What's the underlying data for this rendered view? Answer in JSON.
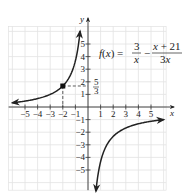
{
  "chart_data": {
    "type": "line",
    "title": "",
    "function_label": "f(x) = 3/x − (x + 21)/(3x)",
    "formula": {
      "lhs": "f(x) =",
      "term1_num": "3",
      "term1_den": "x",
      "minus": "−",
      "term2_num": "x + 21",
      "term2_den": "3x"
    },
    "xlabel": "x",
    "ylabel": "y",
    "xlim": [
      -6.3,
      6.2
    ],
    "ylim": [
      -6.6,
      6.4
    ],
    "x_ticks": [
      -5,
      -4,
      -3,
      -2,
      -1,
      1,
      2,
      3,
      4,
      5
    ],
    "x_tick_labels": [
      "−5",
      "−4",
      "−3",
      "−2",
      "−1",
      "1",
      "2",
      "3",
      "4",
      "5"
    ],
    "y_ticks": [
      -5,
      -4,
      -3,
      -2,
      -1,
      1,
      2,
      3,
      4,
      5
    ],
    "y_tick_labels": [
      "−5",
      "−4",
      "−3",
      "−2",
      "−1",
      "1",
      "2",
      "3",
      "4",
      "5"
    ],
    "grid": true,
    "series": [
      {
        "name": "f(x) left branch",
        "x": [
          -6,
          -5,
          -4,
          -3,
          -2,
          -1.5,
          -1,
          -0.8,
          -0.63
        ],
        "y": [
          0.33,
          0.47,
          0.67,
          1.0,
          1.67,
          2.33,
          3.67,
          4.67,
          6.0
        ]
      },
      {
        "name": "f(x) right branch",
        "x": [
          0.63,
          0.8,
          1,
          1.5,
          2,
          3,
          4,
          5,
          6
        ],
        "y": [
          -6.68,
          -5.33,
          -4.33,
          -3.0,
          -2.33,
          -1.67,
          -1.33,
          -1.13,
          -1.0
        ]
      }
    ],
    "highlighted_point": {
      "x": -2,
      "y": 1.6667,
      "label": "5/3",
      "label_num": "5",
      "label_den": "3"
    },
    "annotations": [
      "dashed guide lines from (-2, 5/3) to both axes"
    ]
  }
}
